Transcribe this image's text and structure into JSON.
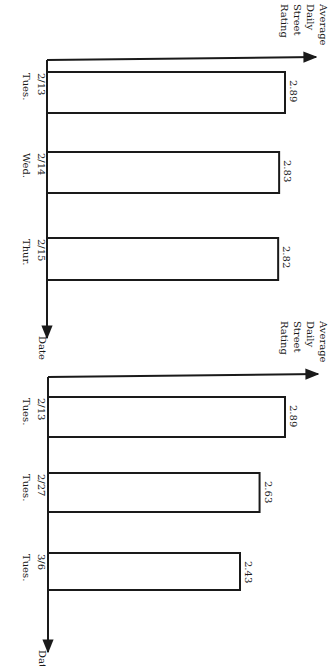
{
  "chart_data": [
    {
      "type": "bar",
      "orientation": "horizontal",
      "title": "",
      "xlabel": "Date",
      "ylabel": "Average Daily Street Rating",
      "ylabel_lines": [
        "Average",
        "Daily",
        "Street",
        "Rating"
      ],
      "categories": [
        "2/13 Tues.",
        "2/14 Wed.",
        "2/15 Thur."
      ],
      "dates": [
        "2/13",
        "2/14",
        "2/15"
      ],
      "days": [
        "Tues.",
        "Wed.",
        "Thur."
      ],
      "values": [
        2.89,
        2.83,
        2.82
      ],
      "value_labels": [
        "2.89",
        "2.83",
        "2.82"
      ],
      "grid": false,
      "legend": null
    },
    {
      "type": "bar",
      "orientation": "horizontal",
      "title": "",
      "xlabel": "Date",
      "ylabel": "Average Daily Street Rating",
      "ylabel_lines": [
        "Average",
        "Daily",
        "Street",
        "Rating"
      ],
      "categories": [
        "2/13 Tues.",
        "2/27 Tues.",
        "3/6 Tues."
      ],
      "dates": [
        "2/13",
        "2/27",
        "3/6"
      ],
      "days": [
        "Tues.",
        "Tues.",
        "Tues."
      ],
      "values": [
        2.89,
        2.63,
        2.43
      ],
      "value_labels": [
        "2.89",
        "2.63",
        "2.43"
      ],
      "grid": false,
      "legend": null
    }
  ],
  "colors": {
    "ink": "#1a1a1a",
    "background": "#ffffff"
  }
}
